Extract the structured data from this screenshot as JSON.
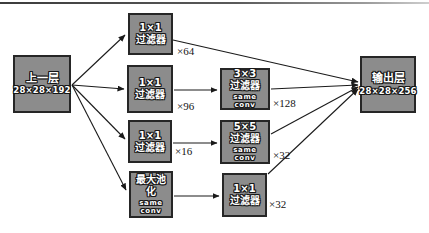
{
  "diagram_title": "inception-module",
  "colors": {
    "background": "#ffffff",
    "box_fill": "#8c8c8c",
    "box_border": "#262626",
    "box_text": "#ffffff",
    "arrow": "#1a1a1a",
    "mult_text": "#141414"
  },
  "nodes": {
    "input": {
      "line1": "上一层",
      "line2": "28×28×192"
    },
    "branch1": {
      "line1": "1×1",
      "line2": "过滤器",
      "mult": "×64"
    },
    "branch2": {
      "line1": "1×1",
      "line2": "过滤器",
      "mult": "×96"
    },
    "branch3": {
      "line1": "1×1",
      "line2": "过滤器",
      "mult": "×16"
    },
    "branch4": {
      "line1": "最大池",
      "line2": "化",
      "line3": "same conv"
    },
    "conv3x3": {
      "line1": "3×3",
      "line2": "过滤器",
      "line3": "same conv",
      "mult": "×128"
    },
    "conv5x5": {
      "line1": "5×5",
      "line2": "过滤器",
      "line3": "same conv",
      "mult": "×32"
    },
    "conv1x1_out": {
      "line1": "1×1",
      "line2": "过滤器",
      "mult": "×32"
    },
    "output": {
      "line1": "输出层",
      "line2": "28×28×256"
    }
  }
}
